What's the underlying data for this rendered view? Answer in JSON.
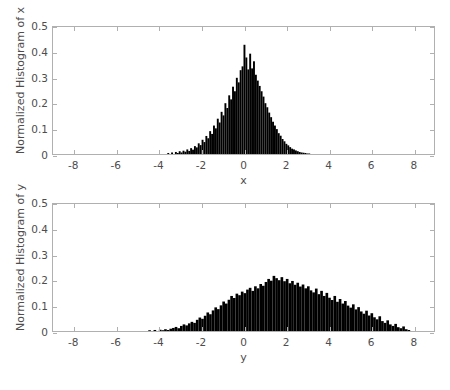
{
  "figure": {
    "background_color": "#ffffff",
    "axis_color": "#b0b0b0",
    "text_color": "#4d4d4d",
    "bar_color": "#000000"
  },
  "chart_data": [
    {
      "type": "bar",
      "id": "histogram-x",
      "title": "",
      "xlabel": "x",
      "ylabel": "Normalized Histogram of x",
      "xlim": [
        -9,
        9
      ],
      "ylim": [
        0,
        0.5
      ],
      "xticks": [
        -8,
        -6,
        -4,
        -2,
        0,
        2,
        4,
        6,
        8
      ],
      "xticklabels": [
        "-8",
        "-6",
        "-4",
        "-2",
        "0",
        "2",
        "4",
        "6",
        "8"
      ],
      "yticks": [
        0,
        0.1,
        0.2,
        0.3,
        0.4,
        0.5
      ],
      "yticklabels": [
        "0",
        "0.1",
        "0.2",
        "0.3",
        "0.4",
        "0.5"
      ],
      "grid": false,
      "legend": null,
      "distribution": {
        "mean": 0.0,
        "std": 1.0,
        "peak": 0.43
      },
      "bin_width": 0.09,
      "bin_centers": [
        -3.555,
        -3.465,
        -3.375,
        -3.285,
        -3.195,
        -3.105,
        -3.015,
        -2.925,
        -2.835,
        -2.745,
        -2.655,
        -2.565,
        -2.475,
        -2.385,
        -2.295,
        -2.205,
        -2.115,
        -2.025,
        -1.935,
        -1.845,
        -1.755,
        -1.665,
        -1.575,
        -1.485,
        -1.395,
        -1.305,
        -1.215,
        -1.125,
        -1.035,
        -0.945,
        -0.855,
        -0.765,
        -0.675,
        -0.585,
        -0.495,
        -0.405,
        -0.315,
        -0.225,
        -0.135,
        -0.045,
        0.045,
        0.135,
        0.225,
        0.315,
        0.405,
        0.495,
        0.585,
        0.675,
        0.765,
        0.855,
        0.945,
        1.035,
        1.125,
        1.215,
        1.305,
        1.395,
        1.485,
        1.575,
        1.665,
        1.755,
        1.845,
        1.935,
        2.025,
        2.115,
        2.205,
        2.295,
        2.385,
        2.475,
        2.565,
        2.655,
        2.745,
        2.835,
        2.925,
        3.015,
        3.105
      ],
      "values": [
        0.004,
        0.0,
        0.006,
        0.0,
        0.008,
        0.004,
        0.011,
        0.006,
        0.013,
        0.009,
        0.018,
        0.012,
        0.023,
        0.017,
        0.031,
        0.026,
        0.042,
        0.035,
        0.056,
        0.047,
        0.071,
        0.062,
        0.09,
        0.079,
        0.112,
        0.101,
        0.139,
        0.124,
        0.166,
        0.152,
        0.2,
        0.181,
        0.231,
        0.215,
        0.265,
        0.247,
        0.3,
        0.282,
        0.33,
        0.345,
        0.43,
        0.38,
        0.333,
        0.395,
        0.337,
        0.365,
        0.312,
        0.289,
        0.268,
        0.247,
        0.226,
        0.2,
        0.184,
        0.163,
        0.145,
        0.127,
        0.112,
        0.098,
        0.082,
        0.072,
        0.059,
        0.05,
        0.04,
        0.034,
        0.027,
        0.021,
        0.018,
        0.014,
        0.011,
        0.008,
        0.006,
        0.005,
        0.004,
        0.002,
        0.002
      ]
    },
    {
      "type": "bar",
      "id": "histogram-y",
      "title": "",
      "xlabel": "y",
      "ylabel": "Normalized Histogram of y",
      "xlim": [
        -9,
        9
      ],
      "ylim": [
        0,
        0.5
      ],
      "xticks": [
        -8,
        -6,
        -4,
        -2,
        0,
        2,
        4,
        6,
        8
      ],
      "xticklabels": [
        "-8",
        "-6",
        "-4",
        "-2",
        "0",
        "2",
        "4",
        "6",
        "8"
      ],
      "yticks": [
        0,
        0.1,
        0.2,
        0.3,
        0.4,
        0.5
      ],
      "yticklabels": [
        "0",
        "0.1",
        "0.2",
        "0.3",
        "0.4",
        "0.5"
      ],
      "grid": false,
      "legend": null,
      "distribution": {
        "mean": 1.5,
        "std": 2.0,
        "peak": 0.22
      },
      "bin_width": 0.125,
      "bin_centers": [
        -4.4375,
        -4.3125,
        -4.1875,
        -4.0625,
        -3.9375,
        -3.8125,
        -3.6875,
        -3.5625,
        -3.4375,
        -3.3125,
        -3.1875,
        -3.0625,
        -2.9375,
        -2.8125,
        -2.6875,
        -2.5625,
        -2.4375,
        -2.3125,
        -2.1875,
        -2.0625,
        -1.9375,
        -1.8125,
        -1.6875,
        -1.5625,
        -1.4375,
        -1.3125,
        -1.1875,
        -1.0625,
        -0.9375,
        -0.8125,
        -0.6875,
        -0.5625,
        -0.4375,
        -0.3125,
        -0.1875,
        -0.0625,
        0.0625,
        0.1875,
        0.3125,
        0.4375,
        0.5625,
        0.6875,
        0.8125,
        0.9375,
        1.0625,
        1.1875,
        1.3125,
        1.4375,
        1.5625,
        1.6875,
        1.8125,
        1.9375,
        2.0625,
        2.1875,
        2.3125,
        2.4375,
        2.5625,
        2.6875,
        2.8125,
        2.9375,
        3.0625,
        3.1875,
        3.3125,
        3.4375,
        3.5625,
        3.6875,
        3.8125,
        3.9375,
        4.0625,
        4.1875,
        4.3125,
        4.4375,
        4.5625,
        4.6875,
        4.8125,
        4.9375,
        5.0625,
        5.1875,
        5.3125,
        5.4375,
        5.5625,
        5.6875,
        5.8125,
        5.9375,
        6.0625,
        6.1875,
        6.3125,
        6.4375,
        6.5625,
        6.6875,
        6.8125,
        6.9375,
        7.0625,
        7.1875,
        7.3125,
        7.4375,
        7.5625,
        7.6875,
        7.8125
      ],
      "values": [
        0.003,
        0.0,
        0.004,
        0.0,
        0.005,
        0.003,
        0.007,
        0.004,
        0.009,
        0.012,
        0.016,
        0.011,
        0.02,
        0.026,
        0.022,
        0.03,
        0.036,
        0.032,
        0.044,
        0.053,
        0.048,
        0.06,
        0.073,
        0.066,
        0.081,
        0.093,
        0.086,
        0.101,
        0.116,
        0.108,
        0.123,
        0.138,
        0.13,
        0.147,
        0.141,
        0.155,
        0.149,
        0.163,
        0.17,
        0.158,
        0.176,
        0.168,
        0.185,
        0.178,
        0.193,
        0.205,
        0.198,
        0.217,
        0.208,
        0.2,
        0.212,
        0.196,
        0.205,
        0.188,
        0.197,
        0.182,
        0.19,
        0.175,
        0.183,
        0.168,
        0.176,
        0.16,
        0.152,
        0.167,
        0.145,
        0.158,
        0.138,
        0.15,
        0.131,
        0.122,
        0.138,
        0.115,
        0.126,
        0.108,
        0.118,
        0.1,
        0.092,
        0.105,
        0.085,
        0.094,
        0.077,
        0.068,
        0.08,
        0.061,
        0.07,
        0.054,
        0.046,
        0.058,
        0.039,
        0.032,
        0.042,
        0.026,
        0.02,
        0.028,
        0.015,
        0.011,
        0.018,
        0.007,
        0.004,
        0.009
      ]
    }
  ]
}
